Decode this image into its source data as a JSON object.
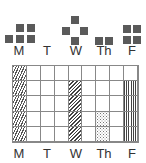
{
  "pictograph": {
    "days": [
      {
        "label": "M",
        "count": 5
      },
      {
        "label": "T",
        "count": 0
      },
      {
        "label": "W",
        "count": 4
      },
      {
        "label": "Th",
        "count": 2
      },
      {
        "label": "F",
        "count": 4
      }
    ],
    "square_color": "#5a5a5a"
  },
  "grid": {
    "columns": 9,
    "rows": 5,
    "day_labels": [
      "M",
      "T",
      "W",
      "Th",
      "F"
    ],
    "filled_columns": [
      {
        "day": "M",
        "col": 0,
        "rows": 5,
        "pattern": "diagonal"
      },
      {
        "day": "W",
        "col": 4,
        "rows": 4,
        "pattern": "diagonal-dense"
      },
      {
        "day": "Th",
        "col": 6,
        "rows": 2,
        "pattern": "dots"
      },
      {
        "day": "F",
        "col": 8,
        "rows": 4,
        "pattern": "vertical"
      }
    ]
  }
}
